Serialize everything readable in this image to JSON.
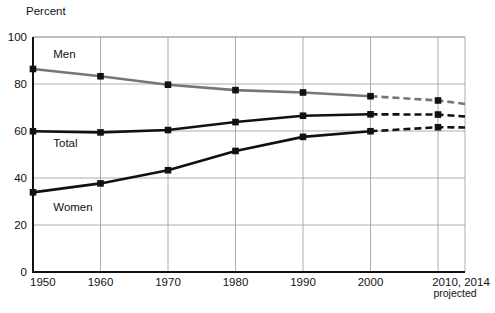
{
  "chart_data": {
    "type": "line",
    "title": "",
    "subtitle": "",
    "xlabel": "",
    "ylabel": "Percent",
    "xlim": [
      1950,
      2014
    ],
    "ylim": [
      0,
      100
    ],
    "grid": true,
    "legend": "inline-labels",
    "x": [
      1950,
      1960,
      1970,
      1980,
      1990,
      2000,
      2010,
      2014
    ],
    "xtick_labels": [
      "1950",
      "1960",
      "1970",
      "1980",
      "1990",
      "2000",
      "2010, 2014"
    ],
    "ytick_labels": [
      "0",
      "20",
      "40",
      "60",
      "80",
      "100"
    ],
    "ytick_values": [
      0,
      20,
      40,
      60,
      80,
      100
    ],
    "projection_note": "projected",
    "projection_starts_at": 2000,
    "series": [
      {
        "name": "Men",
        "color": "#767676",
        "label_x": 1953,
        "label_y": 91,
        "values": [
          86.4,
          83.3,
          79.7,
          77.4,
          76.4,
          74.8,
          73.0,
          71.5
        ]
      },
      {
        "name": "Total",
        "color": "#111111",
        "label_x": 1953,
        "label_y": 53,
        "values": [
          59.9,
          59.4,
          60.4,
          63.8,
          66.5,
          67.1,
          67.0,
          66.2
        ]
      },
      {
        "name": "Women",
        "color": "#111111",
        "label_x": 1953,
        "label_y": 26,
        "values": [
          33.9,
          37.7,
          43.3,
          51.5,
          57.5,
          59.9,
          61.6,
          61.5
        ]
      }
    ]
  }
}
